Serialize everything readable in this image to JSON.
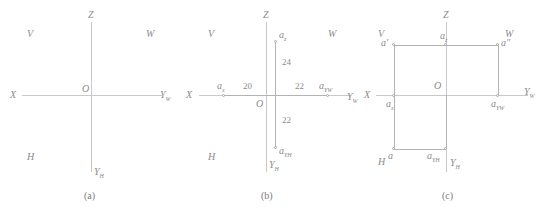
{
  "figure": {
    "caption_a": "(a)",
    "caption_b": "(b)",
    "caption_c": "(c)"
  },
  "axes": {
    "x": "X",
    "z": "Z",
    "yw": "Y",
    "yw_sub": "W",
    "yh": "Y",
    "yh_sub": "H",
    "origin": "O"
  },
  "quadrants": {
    "v": "V",
    "w": "W",
    "h": "H"
  },
  "panel_a": {
    "labels": {
      "x": "X",
      "z": "Z",
      "origin": "O",
      "yw": "Y",
      "yw_sub": "W",
      "yh": "Y",
      "yh_sub": "H",
      "v": "V",
      "w": "W",
      "h": "H"
    }
  },
  "panel_b": {
    "labels": {
      "x": "X",
      "z": "Z",
      "origin": "O",
      "yw": "Y",
      "yw_sub": "W",
      "yh": "Y",
      "yh_sub": "H",
      "v": "V",
      "w": "W",
      "h": "H",
      "a_x": "a",
      "a_x_sub": "x",
      "a_z": "a",
      "a_z_sub": "z",
      "a_yw": "a",
      "a_yw_sub": "Y",
      "a_yw_sub2": "W",
      "a_yh": "a",
      "a_yh_sub": "Y",
      "a_yh_sub2": "H"
    },
    "dimensions": {
      "x_distance": "20",
      "z_distance": "24",
      "yw_distance": "22",
      "yh_distance": "22"
    }
  },
  "panel_c": {
    "labels": {
      "x": "X",
      "z": "Z",
      "origin": "O",
      "yw": "Y",
      "yw_sub": "W",
      "yh": "Y",
      "yh_sub": "H",
      "v": "V",
      "w": "W",
      "h": "H",
      "a_prime": "a′",
      "a_double_prime": "a″",
      "a": "a",
      "a_x": "a",
      "a_x_sub": "x",
      "a_z": "a",
      "a_z_sub": "z",
      "a_yw": "a",
      "a_yw_sub": "Y",
      "a_yw_sub2": "W",
      "a_yh": "a",
      "a_yh_sub": "Y",
      "a_yh_sub2": "H"
    }
  }
}
